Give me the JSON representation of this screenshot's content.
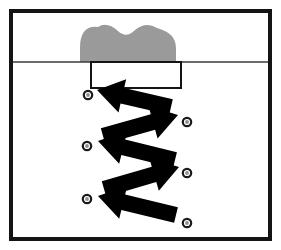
{
  "figure": {
    "background_color": "#ffffff",
    "frame": {
      "name": "outer-frame",
      "x": 11,
      "y": 11,
      "width": 259,
      "height": 228,
      "stroke": "#141414",
      "stroke_width": 4,
      "fill": "#ffffff"
    },
    "boundary_line": {
      "name": "horizontal-boundary-line",
      "x1": 13,
      "x2": 268,
      "y": 62,
      "stroke": "#3b3b3b",
      "stroke_width": 1.4
    },
    "gray_shape": {
      "name": "gray-double-lobe-shape",
      "fill": "#9a9a9a",
      "description": "two rounded lobes resting on the boundary line",
      "left_lobe_center_x": 107,
      "right_lobe_center_x": 146,
      "lobe_radius": 25,
      "base_left_x": 80,
      "base_right_x": 176,
      "base_y": 62,
      "top_y": 25
    },
    "rectangle": {
      "name": "white-rectangle-slab",
      "x": 91,
      "y": 62,
      "width": 90,
      "height": 26,
      "fill": "#ffffff",
      "stroke": "#141414",
      "stroke_width": 2
    },
    "markers": {
      "name": "circle-marker-set",
      "outer_stroke": "#1a1a1a",
      "outer_stroke_width": 2.2,
      "inner_fill": "#8f8f8f",
      "radius": 4.2,
      "inner_radius": 1.9,
      "points": [
        {
          "id": "marker-1",
          "side": "left",
          "cx": 88,
          "cy": 95
        },
        {
          "id": "marker-2",
          "side": "right",
          "cx": 187,
          "cy": 122
        },
        {
          "id": "marker-3",
          "side": "left",
          "cx": 87,
          "cy": 146
        },
        {
          "id": "marker-4",
          "side": "right",
          "cx": 187,
          "cy": 173
        },
        {
          "id": "marker-5",
          "side": "left",
          "cx": 87,
          "cy": 199
        },
        {
          "id": "marker-6",
          "side": "right",
          "cx": 187,
          "cy": 223
        }
      ]
    },
    "arrows": {
      "name": "zigzag-arrow-set",
      "fill": "#000000",
      "count": 5,
      "shaft_half_width": 8,
      "head_half_width": 17,
      "head_length": 26,
      "segments": [
        {
          "id": "arrow-1",
          "direction": "left",
          "tail_x": 171,
          "tail_y": 107,
          "tip_x": 97,
          "tip_y": 90
        },
        {
          "id": "arrow-2",
          "direction": "right",
          "tail_x": 103,
          "tail_y": 136,
          "tip_x": 178,
          "tip_y": 115
        },
        {
          "id": "arrow-3",
          "direction": "left",
          "tail_x": 175,
          "tail_y": 160,
          "tip_x": 98,
          "tip_y": 141
        },
        {
          "id": "arrow-4",
          "direction": "right",
          "tail_x": 104,
          "tail_y": 189,
          "tip_x": 179,
          "tip_y": 167
        },
        {
          "id": "arrow-5",
          "direction": "left",
          "tail_x": 176,
          "tail_y": 215,
          "tip_x": 98,
          "tip_y": 196
        }
      ]
    }
  }
}
